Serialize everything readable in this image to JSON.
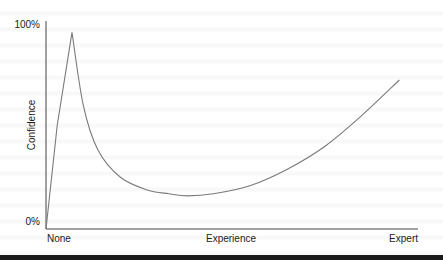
{
  "chart_data": {
    "type": "line",
    "title": "",
    "xlabel": "Experience",
    "ylabel": "Confidence",
    "x_tick_labels": [
      "None",
      "Expert"
    ],
    "y_tick_labels": [
      "0%",
      "100%"
    ],
    "xlim": [
      0,
      100
    ],
    "ylim": [
      0,
      100
    ],
    "grid": false,
    "legend": null,
    "series": [
      {
        "name": "Confidence",
        "x": [
          0,
          3,
          7,
          10,
          14,
          20,
          27,
          33,
          38,
          45,
          55,
          65,
          75,
          85,
          95
        ],
        "y": [
          0,
          50,
          95,
          60,
          38,
          25,
          19,
          17,
          16,
          17,
          21,
          29,
          40,
          55,
          72
        ]
      }
    ]
  },
  "labels": {
    "y_top": "100%",
    "y_bottom": "0%",
    "y_axis": "Confidence",
    "x_left": "None",
    "x_center": "Experience",
    "x_right": "Expert"
  }
}
